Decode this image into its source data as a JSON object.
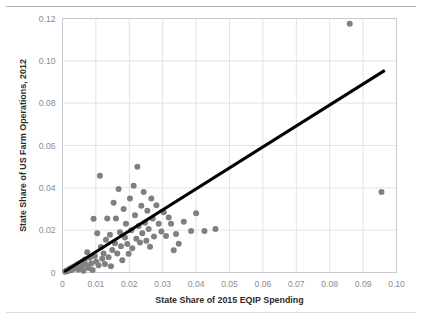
{
  "figure": {
    "background": "#ffffff",
    "marker_color": "#808080",
    "trendline_color": "#000000",
    "grid_color": "#e2e3e5",
    "axis_color": "#c8c9cc",
    "tick_text_color": "#8a8c90",
    "title_text_color": "#2b2b2b"
  },
  "chart_data": {
    "type": "scatter",
    "title": "",
    "xlabel": "State Share of 2015 EQIP Spending",
    "ylabel": "State Share of US Farm Operations, 2012",
    "xlim": [
      0,
      0.1
    ],
    "ylim": [
      0,
      0.12
    ],
    "xticks": [
      0,
      0.01,
      0.02,
      0.03,
      0.04,
      0.05,
      0.06,
      0.07,
      0.08,
      0.09,
      0.1
    ],
    "xtick_labels": [
      "0",
      "0.01",
      "0.02",
      "0.03",
      "0.04",
      "0.05",
      "0.06",
      "0.07",
      "0.08",
      "0.09",
      "0.10"
    ],
    "yticks": [
      0,
      0.02,
      0.04,
      0.06,
      0.08,
      0.1,
      0.12
    ],
    "ytick_labels": [
      "0",
      "0.02",
      "0.04",
      "0.06",
      "0.08",
      "0.10",
      "0.12"
    ],
    "grid": true,
    "legend": null,
    "marker_size": 3,
    "points": [
      [
        0.0008,
        0.0004
      ],
      [
        0.0012,
        0.0009
      ],
      [
        0.0015,
        0.0006
      ],
      [
        0.0019,
        0.0013
      ],
      [
        0.0022,
        0.0019
      ],
      [
        0.0026,
        0.0011
      ],
      [
        0.003,
        0.0025
      ],
      [
        0.0033,
        0.0016
      ],
      [
        0.0037,
        0.0031
      ],
      [
        0.0041,
        0.0022
      ],
      [
        0.0045,
        0.0039
      ],
      [
        0.0048,
        0.0014
      ],
      [
        0.0052,
        0.0045
      ],
      [
        0.0056,
        0.0028
      ],
      [
        0.006,
        0.0052
      ],
      [
        0.0063,
        0.0008
      ],
      [
        0.0067,
        0.0061
      ],
      [
        0.0071,
        0.0036
      ],
      [
        0.0074,
        0.0096
      ],
      [
        0.0078,
        0.0021
      ],
      [
        0.0082,
        0.007
      ],
      [
        0.0086,
        0.0043
      ],
      [
        0.009,
        0.0012
      ],
      [
        0.0093,
        0.0254
      ],
      [
        0.0097,
        0.0078
      ],
      [
        0.0101,
        0.0051
      ],
      [
        0.0104,
        0.0186
      ],
      [
        0.0108,
        0.0034
      ],
      [
        0.0112,
        0.0457
      ],
      [
        0.0115,
        0.012
      ],
      [
        0.0119,
        0.0065
      ],
      [
        0.0123,
        0.009
      ],
      [
        0.0127,
        0.004
      ],
      [
        0.013,
        0.0155
      ],
      [
        0.0134,
        0.0255
      ],
      [
        0.0138,
        0.0072
      ],
      [
        0.0142,
        0.0178
      ],
      [
        0.0145,
        0.003
      ],
      [
        0.0149,
        0.0106
      ],
      [
        0.0153,
        0.033
      ],
      [
        0.0157,
        0.0138
      ],
      [
        0.016,
        0.0255
      ],
      [
        0.0164,
        0.009
      ],
      [
        0.0168,
        0.0395
      ],
      [
        0.0172,
        0.019
      ],
      [
        0.0175,
        0.0124
      ],
      [
        0.0179,
        0.0058
      ],
      [
        0.0183,
        0.03
      ],
      [
        0.0187,
        0.0165
      ],
      [
        0.019,
        0.023
      ],
      [
        0.0194,
        0.0135
      ],
      [
        0.0198,
        0.0088
      ],
      [
        0.0202,
        0.035
      ],
      [
        0.0206,
        0.02
      ],
      [
        0.0209,
        0.0115
      ],
      [
        0.0213,
        0.041
      ],
      [
        0.0217,
        0.027
      ],
      [
        0.0221,
        0.016
      ],
      [
        0.0224,
        0.05
      ],
      [
        0.0228,
        0.022
      ],
      [
        0.0232,
        0.0142
      ],
      [
        0.0236,
        0.0315
      ],
      [
        0.0239,
        0.0185
      ],
      [
        0.0243,
        0.038
      ],
      [
        0.0247,
        0.0235
      ],
      [
        0.0251,
        0.015
      ],
      [
        0.0254,
        0.0292
      ],
      [
        0.0258,
        0.0205
      ],
      [
        0.0262,
        0.0122
      ],
      [
        0.0266,
        0.035
      ],
      [
        0.027,
        0.0255
      ],
      [
        0.0274,
        0.017
      ],
      [
        0.0281,
        0.0318
      ],
      [
        0.0288,
        0.023
      ],
      [
        0.0296,
        0.0194
      ],
      [
        0.0303,
        0.0285
      ],
      [
        0.031,
        0.0172
      ],
      [
        0.0318,
        0.026
      ],
      [
        0.0325,
        0.023
      ],
      [
        0.0333,
        0.0105
      ],
      [
        0.034,
        0.0182
      ],
      [
        0.0348,
        0.0136
      ],
      [
        0.0363,
        0.024
      ],
      [
        0.0385,
        0.0196
      ],
      [
        0.04,
        0.028
      ],
      [
        0.0425,
        0.0196
      ],
      [
        0.0458,
        0.0205
      ],
      [
        0.086,
        0.1175
      ],
      [
        0.0955,
        0.038
      ]
    ],
    "trendline": {
      "type": "line",
      "x": [
        0.0005,
        0.0965
      ],
      "y": [
        0.0004,
        0.0955
      ],
      "width": 3
    }
  }
}
